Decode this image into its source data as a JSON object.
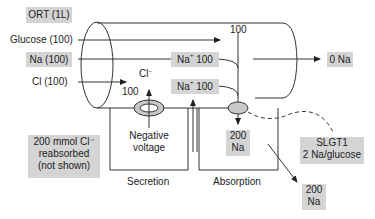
{
  "title": "ORT (1L)",
  "inputs": {
    "glucose": "Glucose (100)",
    "na": "Na (100)",
    "cl": "Cl (100)"
  },
  "lumen": {
    "na_box_1": {
      "ion": "Na",
      "charge": "+",
      "value": "100"
    },
    "na_box_2": {
      "ion": "Na",
      "charge": "+",
      "value": "100"
    },
    "combined_flow": "100",
    "output": "0 Na",
    "cl_label": {
      "ion": "Cl",
      "charge": "−"
    },
    "cl_value": "100"
  },
  "secretion": {
    "channel_note": "Negative\nvoltage",
    "label": "Secretion"
  },
  "absorption": {
    "na_total": "200\nNa",
    "label": "Absorption",
    "exit_na": "200\nNa"
  },
  "notes": {
    "cl_reabsorbed": "200 mmol Cl⁻\nreabsorbed\n(not shown)",
    "transporter": "SLGT1\n2 Na/glucose"
  },
  "colors": {
    "label_box": "#d4d4d4",
    "line": "#333333",
    "transporter_fill": "#c8c8c8"
  }
}
